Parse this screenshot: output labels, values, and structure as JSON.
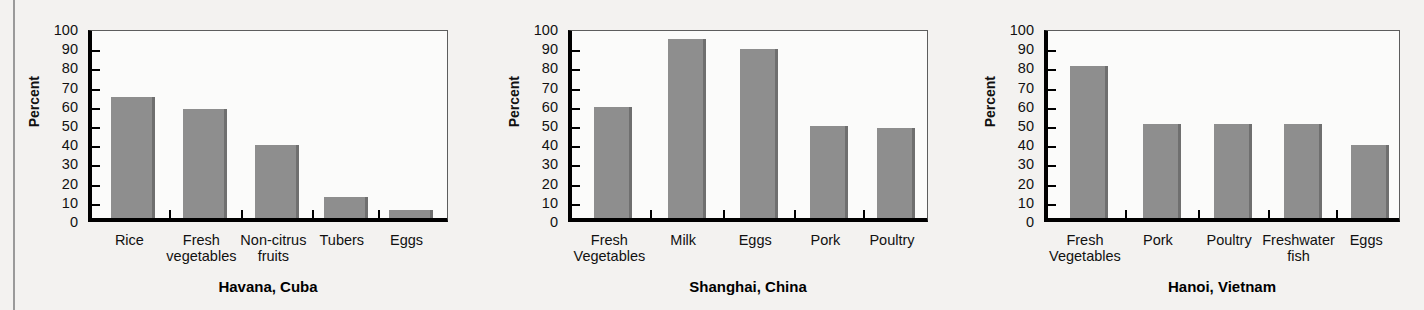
{
  "figure": {
    "background_color": "#f3f2f0",
    "bar_color": "#8e8e8e",
    "axis_color": "#000000"
  },
  "chart_data": [
    {
      "type": "bar",
      "title": "Havana, Cuba",
      "xlabel": "",
      "ylabel": "Percent",
      "ylim": [
        0,
        100
      ],
      "yticks": [
        0,
        10,
        20,
        30,
        40,
        50,
        60,
        70,
        80,
        90,
        100
      ],
      "ytick_labels": [
        "0",
        "10",
        "20",
        "30",
        "40",
        "50",
        "60",
        "70",
        "80",
        "90",
        "100"
      ],
      "grid": false,
      "legend": "none",
      "categories": [
        "Rice",
        "Fresh\nvegetables",
        "Non-citrus\nfruits",
        "Tubers",
        "Eggs"
      ],
      "values": [
        63,
        57,
        38,
        11,
        4
      ]
    },
    {
      "type": "bar",
      "title": "Shanghai, China",
      "xlabel": "",
      "ylabel": "Percent",
      "ylim": [
        0,
        100
      ],
      "yticks": [
        0,
        10,
        20,
        30,
        40,
        50,
        60,
        70,
        80,
        90,
        100
      ],
      "ytick_labels": [
        "0",
        "10",
        "20",
        "30",
        "40",
        "50",
        "60",
        "70",
        "80",
        "90",
        "100"
      ],
      "grid": false,
      "legend": "none",
      "categories": [
        "Fresh\nVegetables",
        "Milk",
        "Eggs",
        "Pork",
        "Poultry"
      ],
      "values": [
        58,
        93,
        88,
        48,
        47
      ]
    },
    {
      "type": "bar",
      "title": "Hanoi, Vietnam",
      "xlabel": "",
      "ylabel": "Percent",
      "ylim": [
        0,
        100
      ],
      "yticks": [
        0,
        10,
        20,
        30,
        40,
        50,
        60,
        70,
        80,
        90,
        100
      ],
      "ytick_labels": [
        "0",
        "10",
        "20",
        "30",
        "40",
        "50",
        "60",
        "70",
        "80",
        "90",
        "100"
      ],
      "grid": false,
      "legend": "none",
      "categories": [
        "Fresh\nVegetables",
        "Pork",
        "Poultry",
        "Freshwater\nfish",
        "Eggs"
      ],
      "values": [
        79,
        49,
        49,
        49,
        38
      ]
    }
  ]
}
